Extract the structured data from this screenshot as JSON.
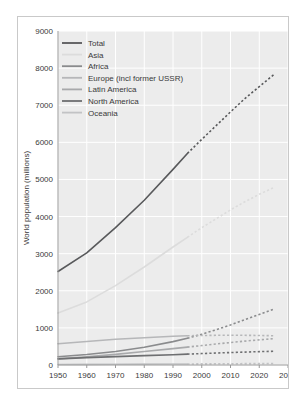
{
  "chart_data": {
    "type": "line",
    "title": "",
    "xlabel": "",
    "ylabel": "World population (millions)",
    "xlim": [
      1950,
      2030
    ],
    "ylim": [
      0,
      9000
    ],
    "xticks": [
      1950,
      1960,
      1970,
      1980,
      1990,
      2000,
      2010,
      2020,
      2030
    ],
    "yticks": [
      0,
      1000,
      2000,
      3000,
      4000,
      5000,
      6000,
      7000,
      8000,
      9000
    ],
    "grid": true,
    "legend_position": "upper-left",
    "projection_note": "Solid lines show historical data to 1995; dotted lines show projections from 1995 to 2025.",
    "series": [
      {
        "name": "Total",
        "color": "#58595b",
        "historical": {
          "x": [
            1950,
            1960,
            1970,
            1980,
            1990,
            1995
          ],
          "y": [
            2520,
            3020,
            3700,
            4440,
            5270,
            5700
          ]
        },
        "projected": {
          "x": [
            1995,
            2000,
            2005,
            2010,
            2015,
            2020,
            2025
          ],
          "y": [
            5700,
            6080,
            6450,
            6820,
            7180,
            7500,
            7820
          ]
        }
      },
      {
        "name": "Asia",
        "color": "#dcdcdc",
        "historical": {
          "x": [
            1950,
            1960,
            1970,
            1980,
            1990,
            1995
          ],
          "y": [
            1400,
            1700,
            2140,
            2640,
            3180,
            3440
          ]
        },
        "projected": {
          "x": [
            1995,
            2000,
            2005,
            2010,
            2015,
            2020,
            2025
          ],
          "y": [
            3440,
            3700,
            3940,
            4180,
            4400,
            4600,
            4780
          ]
        }
      },
      {
        "name": "Africa",
        "color": "#8a8b8d",
        "historical": {
          "x": [
            1950,
            1960,
            1970,
            1980,
            1990,
            1995
          ],
          "y": [
            224,
            282,
            364,
            478,
            630,
            720
          ]
        },
        "projected": {
          "x": [
            1995,
            2000,
            2005,
            2010,
            2015,
            2020,
            2025
          ],
          "y": [
            720,
            830,
            950,
            1080,
            1220,
            1360,
            1500
          ]
        }
      },
      {
        "name": "Europe (incl former USSR)",
        "color": "#b6b7b9",
        "historical": {
          "x": [
            1950,
            1960,
            1970,
            1980,
            1990,
            1995
          ],
          "y": [
            572,
            634,
            692,
            733,
            776,
            788
          ]
        },
        "projected": {
          "x": [
            1995,
            2000,
            2005,
            2010,
            2015,
            2020,
            2025
          ],
          "y": [
            788,
            795,
            800,
            802,
            800,
            795,
            788
          ]
        }
      },
      {
        "name": "Latin America",
        "color": "#a8a9ab",
        "historical": {
          "x": [
            1950,
            1960,
            1970,
            1980,
            1990,
            1995
          ],
          "y": [
            166,
            218,
            286,
            362,
            440,
            482
          ]
        },
        "projected": {
          "x": [
            1995,
            2000,
            2005,
            2010,
            2015,
            2020,
            2025
          ],
          "y": [
            482,
            524,
            566,
            606,
            644,
            678,
            710
          ]
        }
      },
      {
        "name": "North America",
        "color": "#6e6f71",
        "historical": {
          "x": [
            1950,
            1960,
            1970,
            1980,
            1990,
            1995
          ],
          "y": [
            166,
            199,
            227,
            252,
            278,
            292
          ]
        },
        "projected": {
          "x": [
            1995,
            2000,
            2005,
            2010,
            2015,
            2020,
            2025
          ],
          "y": [
            292,
            308,
            322,
            336,
            348,
            360,
            370
          ]
        }
      },
      {
        "name": "Oceania",
        "color": "#c2c3c5",
        "historical": {
          "x": [
            1950,
            1960,
            1970,
            1980,
            1990,
            1995
          ],
          "y": [
            12,
            16,
            19,
            23,
            26,
            28
          ]
        },
        "projected": {
          "x": [
            1995,
            2000,
            2005,
            2010,
            2015,
            2020,
            2025
          ],
          "y": [
            28,
            30,
            32,
            34,
            36,
            38,
            40
          ]
        }
      }
    ]
  },
  "axes": {
    "ylabel": "World population (millions)",
    "xtick_labels": [
      "1950",
      "1960",
      "1970",
      "1980",
      "1990",
      "2000",
      "2010",
      "2020",
      "2030"
    ],
    "ytick_labels": [
      "0",
      "1000",
      "2000",
      "3000",
      "4000",
      "5000",
      "6000",
      "7000",
      "8000",
      "9000"
    ]
  },
  "legend": {
    "items": [
      {
        "label": "Total",
        "color": "#58595b"
      },
      {
        "label": "Asia",
        "color": "#dcdcdc"
      },
      {
        "label": "Africa",
        "color": "#8a8b8d"
      },
      {
        "label": "Europe (incl former USSR)",
        "color": "#b6b7b9"
      },
      {
        "label": "Latin America",
        "color": "#a8a9ab"
      },
      {
        "label": "North America",
        "color": "#6e6f71"
      },
      {
        "label": "Oceania",
        "color": "#c2c3c5"
      }
    ]
  },
  "style": {
    "plot_background": "#ececec",
    "gridline_color": "#ffffff",
    "frame_border": "#c9c9c9",
    "text_color": "#3a3a3a",
    "page_background": "#ffffff"
  }
}
